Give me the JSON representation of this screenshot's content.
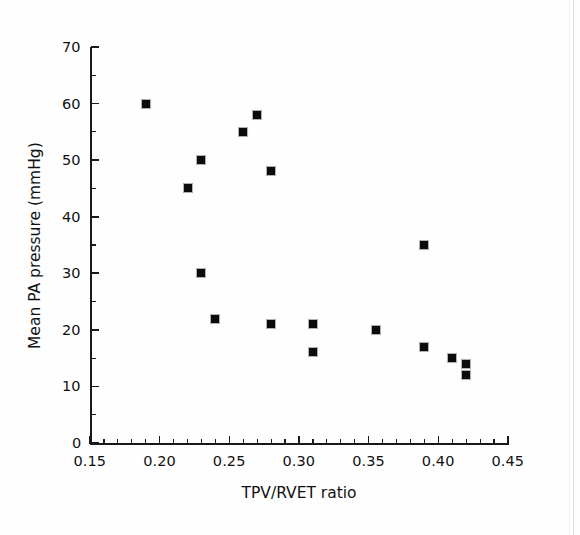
{
  "chart_data": {
    "type": "scatter",
    "title": "",
    "xlabel": "TPV/RVET ratio",
    "ylabel": "Mean PA pressure (mmHg)",
    "xlim": [
      0.15,
      0.45
    ],
    "ylim": [
      0,
      70
    ],
    "xticks": [
      "0.15",
      "0.20",
      "0.25",
      "0.30",
      "0.35",
      "0.40",
      "0.45"
    ],
    "xtick_values": [
      0.15,
      0.2,
      0.25,
      0.3,
      0.35,
      0.4,
      0.45
    ],
    "x_minor_step": 0.01,
    "yticks": [
      "0",
      "10",
      "20",
      "30",
      "40",
      "50",
      "60",
      "70"
    ],
    "ytick_values": [
      0,
      10,
      20,
      30,
      40,
      50,
      60,
      70
    ],
    "y_minor_step": 5,
    "grid": false,
    "legend": false,
    "marker": "filled-square",
    "marker_color": "#0b0b0b",
    "points": [
      {
        "x": 0.19,
        "y": 60
      },
      {
        "x": 0.22,
        "y": 45
      },
      {
        "x": 0.23,
        "y": 50
      },
      {
        "x": 0.23,
        "y": 30
      },
      {
        "x": 0.24,
        "y": 22
      },
      {
        "x": 0.26,
        "y": 55
      },
      {
        "x": 0.27,
        "y": 58
      },
      {
        "x": 0.28,
        "y": 48
      },
      {
        "x": 0.28,
        "y": 21
      },
      {
        "x": 0.31,
        "y": 21
      },
      {
        "x": 0.31,
        "y": 16
      },
      {
        "x": 0.355,
        "y": 20
      },
      {
        "x": 0.39,
        "y": 35
      },
      {
        "x": 0.39,
        "y": 17
      },
      {
        "x": 0.41,
        "y": 15
      },
      {
        "x": 0.42,
        "y": 14
      },
      {
        "x": 0.42,
        "y": 12
      }
    ]
  }
}
